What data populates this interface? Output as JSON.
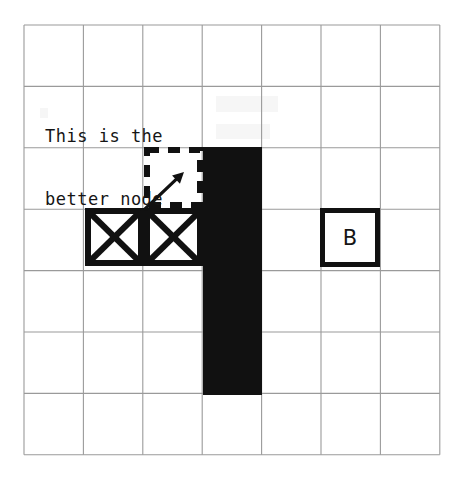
{
  "figure": {
    "background_color": "#ffffff",
    "width": 475,
    "height": 482
  },
  "grid": {
    "origin_x": 24,
    "origin_y": 25,
    "cols": 7,
    "rows": 7,
    "cell_w": 59.4,
    "cell_h": 61.4,
    "line_color": "#9a9a9a",
    "line_width": 1.1
  },
  "annotation": {
    "text": "This is the better node",
    "lines": [
      "This is the",
      "better node"
    ],
    "color": "#151515",
    "x": 45,
    "y": 84
  },
  "obstacle": {
    "name": "wall",
    "fill_color": "#111111",
    "x": 203,
    "y": 147,
    "width": 59,
    "height": 248,
    "grid_col": 3,
    "grid_row_start": 2,
    "grid_row_span": 4
  },
  "closed_nodes": {
    "symbol": "x-square",
    "stroke_color": "#111111",
    "stroke_width": 6,
    "count": 2,
    "cells": [
      {
        "label": "",
        "x": 85,
        "y": 208,
        "width": 59,
        "height": 58,
        "grid_col": 1,
        "grid_row": 3
      },
      {
        "label": "",
        "x": 144,
        "y": 208,
        "width": 59,
        "height": 58,
        "grid_col": 2,
        "grid_row": 3
      }
    ]
  },
  "candidate_node": {
    "symbol": "dashed-square",
    "stroke_color": "#111111",
    "stroke_width": 6,
    "dash_pattern": "12 9",
    "x": 144,
    "y": 147,
    "width": 59,
    "height": 61,
    "grid_col": 2,
    "grid_row": 2
  },
  "arrow": {
    "name": "pointer-arrow",
    "color": "#111111",
    "stroke_width": 3.2,
    "from_x": 145,
    "from_y": 209,
    "to_x": 184,
    "to_y": 172,
    "head_size": 11
  },
  "goal_node": {
    "label": "B",
    "symbol": "open-square",
    "stroke_color": "#111111",
    "stroke_width": 5,
    "x": 320,
    "y": 208,
    "width": 60,
    "height": 59,
    "grid_col": 5,
    "grid_row": 3
  },
  "chart_data": {
    "type": "diagram",
    "grid_size": [
      7,
      7
    ],
    "legend": [
      {
        "symbol": "x-square",
        "meaning": "closed / visited node"
      },
      {
        "symbol": "dashed-square",
        "meaning": "candidate (better) node"
      },
      {
        "symbol": "filled-black",
        "meaning": "wall / obstacle"
      },
      {
        "symbol": "open-square-B",
        "meaning": "goal node B"
      }
    ],
    "annotations": [
      {
        "text": "This is the better node",
        "points_to": [
          2,
          2
        ]
      }
    ]
  }
}
